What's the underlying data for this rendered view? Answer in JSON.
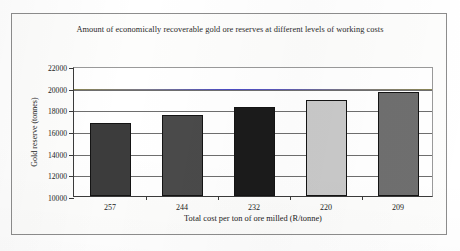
{
  "figure": {
    "title": "Amount of economically recoverable gold ore reserves at different levels of working costs"
  },
  "chart_data": {
    "type": "bar",
    "title": "Amount of economically recoverable gold ore reserves at different levels of working costs",
    "xlabel": "Total cost per ton of ore milled (R/tonne)",
    "ylabel": "Gold reserve (tonnes)",
    "categories": [
      "257",
      "244",
      "232",
      "220",
      "209"
    ],
    "values": [
      16700,
      17500,
      18200,
      18900,
      19600
    ],
    "bar_colors": [
      "#3c3c3c",
      "#4a4a4a",
      "#1b1b1b",
      "#c9c9c9",
      "#6f6f6f"
    ],
    "ylim": [
      10000,
      22000
    ],
    "yticks": [
      "22000",
      "20000",
      "18000",
      "16000",
      "14000",
      "12000",
      "10000"
    ],
    "ytick_values": [
      22000,
      20000,
      18000,
      16000,
      14000,
      12000,
      10000
    ],
    "grid": true,
    "legend": "none",
    "annotations": [
      {
        "name": "reference-line",
        "value": 20000,
        "color": "#4b4bc4",
        "description": "horizontal reference line at 20000 tonnes"
      }
    ]
  }
}
